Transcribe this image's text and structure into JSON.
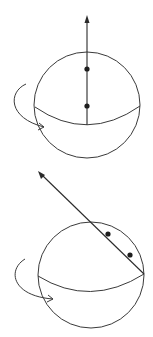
{
  "diagram": {
    "colors": {
      "line": "#3a3a3a",
      "dot": "#1e1e1e",
      "background": "#ffffff"
    },
    "panels": [
      {
        "id": "top",
        "sphere": {
          "cx": 87,
          "cy": 105,
          "r": 53
        },
        "equator": {
          "start": [
            35,
            107
          ],
          "control": [
            87,
            143
          ],
          "end": [
            140,
            106
          ]
        },
        "axis": {
          "from": [
            87,
            125
          ],
          "to": [
            87,
            16
          ],
          "orientation": "vertical"
        },
        "dots": [
          {
            "cx": 87,
            "cy": 69
          },
          {
            "cx": 87,
            "cy": 106
          }
        ],
        "rotation_arrow": {
          "path": "M26,84 C8,92 8,118 44,127"
        }
      },
      {
        "id": "bottom",
        "sphere": {
          "cx": 91,
          "cy": 275,
          "r": 53
        },
        "equator": {
          "start": [
            38,
            276
          ],
          "control": [
            90,
            308
          ],
          "end": [
            144,
            274
          ]
        },
        "axis": {
          "from": [
            144,
            274
          ],
          "to": [
            39,
            172
          ],
          "orientation": "tilted"
        },
        "dots": [
          {
            "cx": 108,
            "cy": 234
          },
          {
            "cx": 130,
            "cy": 255
          }
        ],
        "rotation_arrow": {
          "path": "M25,259 C7,270 12,296 53,299"
        }
      }
    ]
  }
}
